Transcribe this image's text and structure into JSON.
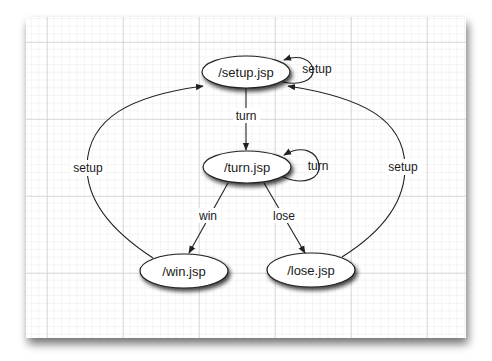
{
  "diagram": {
    "type": "state-transition",
    "background": "graph-paper",
    "colors": {
      "paper": "#ffffff",
      "grid_minor": "#e3e3e3",
      "grid_major": "#c4c4c4",
      "stroke": "#222222",
      "text": "#1a1a1a"
    },
    "nodes": [
      {
        "id": "setup",
        "label": "/setup.jsp"
      },
      {
        "id": "turn",
        "label": "/turn.jsp"
      },
      {
        "id": "win",
        "label": "/win.jsp"
      },
      {
        "id": "lose",
        "label": "/lose.jsp"
      }
    ],
    "edges": [
      {
        "from": "setup",
        "to": "setup",
        "label": "setup"
      },
      {
        "from": "setup",
        "to": "turn",
        "label": "turn"
      },
      {
        "from": "turn",
        "to": "turn",
        "label": "turn"
      },
      {
        "from": "turn",
        "to": "win",
        "label": "win"
      },
      {
        "from": "turn",
        "to": "lose",
        "label": "lose"
      },
      {
        "from": "win",
        "to": "setup",
        "label": "setup"
      },
      {
        "from": "lose",
        "to": "setup",
        "label": "setup"
      }
    ]
  }
}
